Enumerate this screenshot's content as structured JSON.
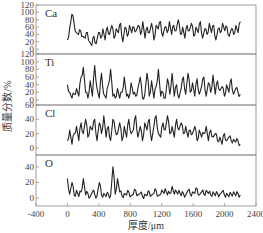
{
  "chart_data": {
    "type": "line",
    "title": "",
    "xlabel": "厚度/μm",
    "ylabel": "质量分数/%",
    "xlim": [
      -400,
      2400
    ],
    "x_ticks": [
      -400,
      0,
      400,
      800,
      1200,
      1600,
      2000,
      2400
    ],
    "grid": false,
    "legend": "none (element labels inside panels)",
    "layout": "4 vertically stacked panels sharing x-axis",
    "panels": [
      {
        "label": "Ca",
        "ylim": [
          -13,
          120
        ],
        "y_ticks": [
          0,
          20,
          40,
          60,
          80,
          100,
          120
        ],
        "x_range": [
          0,
          2200
        ],
        "description": "Highly oscillating profile, mostly 20–80, spike ~95 near x≈60",
        "values": [
          25,
          55,
          95,
          70,
          45,
          40,
          50,
          35,
          30,
          45,
          20,
          10,
          35,
          15,
          45,
          30,
          55,
          25,
          60,
          40,
          65,
          30,
          55,
          45,
          70,
          20,
          60,
          35,
          65,
          45,
          60,
          50,
          65,
          40,
          75,
          30,
          60,
          45,
          70,
          25,
          65,
          55,
          75,
          35,
          60,
          45,
          75,
          40,
          65,
          50,
          80,
          40,
          60,
          30,
          65,
          50,
          70,
          35,
          60,
          45,
          75,
          30,
          55,
          40,
          70,
          45,
          65,
          25,
          55,
          45,
          70,
          50,
          60,
          35,
          55,
          40,
          65,
          45,
          75
        ]
      },
      {
        "label": "Ti",
        "ylim": [
          -13,
          120
        ],
        "y_ticks": [
          0,
          20,
          40,
          60,
          80,
          100,
          120
        ],
        "x_range": [
          0,
          2200
        ],
        "description": "Sparse spiky profile, baseline ~5–20, peaks up to ~90",
        "values": [
          40,
          20,
          5,
          15,
          30,
          10,
          60,
          85,
          20,
          5,
          50,
          10,
          90,
          30,
          5,
          70,
          15,
          5,
          40,
          80,
          10,
          5,
          30,
          5,
          20,
          60,
          10,
          5,
          45,
          15,
          10,
          30,
          60,
          5,
          15,
          70,
          10,
          50,
          5,
          35,
          80,
          10,
          20,
          5,
          55,
          15,
          70,
          10,
          40,
          5,
          30,
          60,
          15,
          70,
          20,
          45,
          10,
          55,
          15,
          35,
          60,
          10,
          45,
          20,
          65,
          15,
          50,
          25,
          35,
          10,
          40,
          20,
          55,
          15,
          30,
          20,
          15
        ]
      },
      {
        "label": "Cl",
        "ylim": [
          -10,
          60
        ],
        "y_ticks": [
          0,
          20,
          40,
          60
        ],
        "x_range": [
          0,
          2200
        ],
        "description": "Oscillating 5–45, declining to ~10 toward end",
        "values": [
          10,
          25,
          5,
          20,
          30,
          10,
          35,
          20,
          40,
          15,
          30,
          25,
          40,
          10,
          35,
          20,
          45,
          15,
          30,
          10,
          40,
          25,
          20,
          35,
          10,
          30,
          15,
          40,
          20,
          25,
          45,
          15,
          30,
          10,
          35,
          25,
          40,
          10,
          30,
          45,
          20,
          15,
          35,
          25,
          45,
          20,
          30,
          15,
          40,
          25,
          35,
          20,
          30,
          15,
          25,
          20,
          30,
          10,
          25,
          15,
          20,
          30,
          10,
          25,
          15,
          20,
          10,
          15,
          5,
          20,
          10,
          15,
          10,
          12,
          8,
          10,
          5
        ]
      },
      {
        "label": "O",
        "ylim": [
          -10,
          55
        ],
        "y_ticks": [
          0,
          20,
          40
        ],
        "x_range": [
          0,
          2200
        ],
        "description": "Low baseline ~0–10 with sharp spikes (~25 at start, ~40 near x≈600)",
        "values": [
          25,
          5,
          20,
          3,
          10,
          2,
          8,
          25,
          4,
          6,
          2,
          8,
          5,
          3,
          20,
          4,
          6,
          2,
          5,
          3,
          40,
          5,
          25,
          8,
          3,
          6,
          4,
          8,
          3,
          5,
          10,
          4,
          6,
          2,
          5,
          3,
          8,
          4,
          6,
          10,
          3,
          5,
          8,
          12,
          4,
          6,
          15,
          5,
          8,
          10,
          3,
          6,
          4,
          10,
          5,
          8,
          6,
          12,
          4,
          8,
          5,
          10,
          6,
          4,
          8,
          3,
          6,
          5,
          8,
          4,
          6,
          2,
          5,
          8,
          3,
          6,
          4
        ]
      }
    ]
  },
  "axes": {
    "x_title": "厚度/μm",
    "y_title": "质量分数/%",
    "x_tick_labels": [
      "-400",
      "0",
      "400",
      "800",
      "1200",
      "1600",
      "2000",
      "2400"
    ],
    "panel_y_tick_labels": {
      "Ca": [
        "0",
        "20",
        "40",
        "60",
        "80",
        "100",
        "120"
      ],
      "Ti": [
        "0",
        "20",
        "40",
        "60",
        "80",
        "100",
        "120"
      ],
      "Cl": [
        "0",
        "20",
        "40",
        "60"
      ],
      "O": [
        "0",
        "20",
        "40"
      ]
    }
  },
  "colors": {
    "frame": "#888888",
    "series": "#222222",
    "text": "#444444"
  }
}
